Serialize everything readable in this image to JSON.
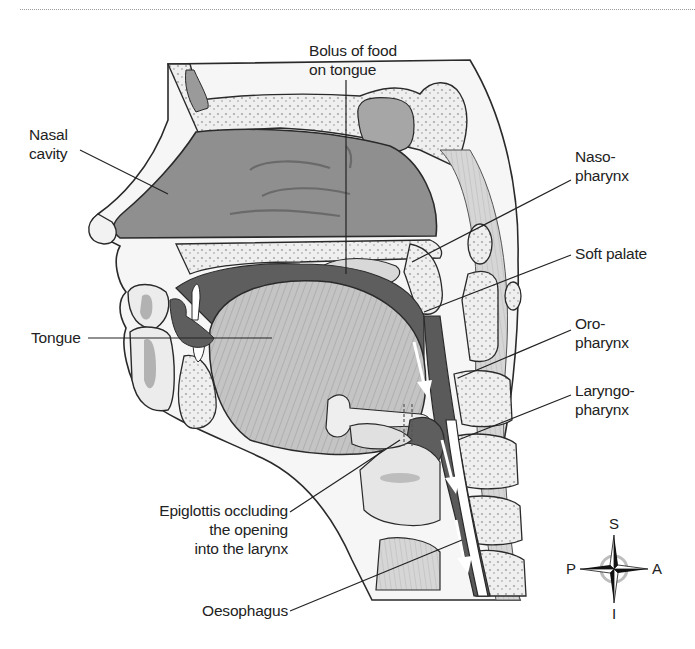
{
  "figure": {
    "labels": {
      "bolus": [
        "Bolus of food",
        "on tongue"
      ],
      "nasal_cavity": [
        "Nasal",
        "cavity"
      ],
      "nasopharynx": [
        "Naso-",
        "pharynx"
      ],
      "soft_palate": [
        "Soft palate"
      ],
      "tongue": [
        "Tongue"
      ],
      "oropharynx": [
        "Oro-",
        "pharynx"
      ],
      "laryngopharynx": [
        "Laryngo-",
        "pharynx"
      ],
      "epiglottis": [
        "Epiglottis occluding",
        "the opening",
        "into the larynx"
      ],
      "oesophagus": [
        "Oesophagus"
      ]
    },
    "compass": {
      "top": "S",
      "bottom": "I",
      "left": "P",
      "right": "A"
    },
    "colors": {
      "cavity_fill": "#8c8c8c",
      "dark_fill": "#5e5e5e",
      "bone_fill": "#ececec",
      "muscle_fill": "#b8b8b8",
      "soft_tissue": "#f4f4f4",
      "outline": "#2a2a2a"
    }
  }
}
